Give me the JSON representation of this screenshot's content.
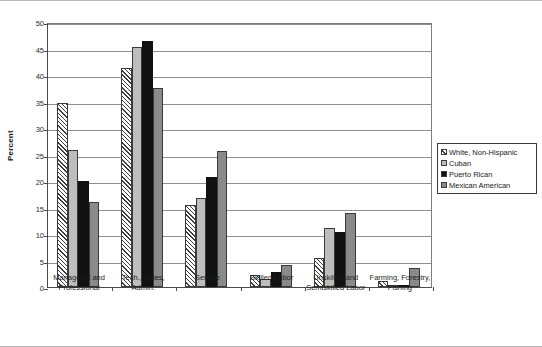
{
  "chart_data": {
    "type": "bar",
    "title": "",
    "xlabel": "",
    "ylabel": "Percent",
    "ylim": [
      0,
      50
    ],
    "yticks": [
      0,
      5,
      10,
      15,
      20,
      25,
      30,
      35,
      40,
      45,
      50
    ],
    "grid": true,
    "legend_position": "right",
    "categories": [
      "Managerial and Professional",
      "Tech., Sales, Admin.",
      "Service",
      "Skilled Labor",
      "Unskilled and Semiskilled  Labor",
      "Farming, Forestry, Fishing"
    ],
    "category_lines": [
      [
        "Managerial and",
        "Professional"
      ],
      [
        "Tech., Sales,",
        "Admin."
      ],
      [
        "Service"
      ],
      [
        "Skilled Labor"
      ],
      [
        "Unskilled and",
        "Semiskilled  Labor"
      ],
      [
        "Farming, Forestry,",
        "Fishing"
      ]
    ],
    "series": [
      {
        "name": "White, Non-Hispanic",
        "fill": "hatch",
        "color": "#ffffff",
        "values": [
          34.8,
          41.3,
          15.5,
          2.2,
          5.4,
          1.2
        ]
      },
      {
        "name": "Cuban",
        "fill": "lightgray",
        "color": "#bdbdbd",
        "values": [
          25.8,
          45.2,
          16.8,
          1.5,
          11.1,
          0.2
        ]
      },
      {
        "name": "Puerto Rican",
        "fill": "black",
        "color": "#111111",
        "values": [
          20.0,
          46.4,
          20.7,
          2.8,
          10.4,
          0.3
        ]
      },
      {
        "name": "Mexican American",
        "fill": "midgray",
        "color": "#8a8a8a",
        "values": [
          16.0,
          37.6,
          25.7,
          4.2,
          14.0,
          3.5
        ]
      }
    ]
  },
  "legend": {
    "items": [
      "White, Non-Hispanic",
      "Cuban",
      "Puerto Rican",
      "Mexican American"
    ]
  },
  "axis": {
    "y_label": "Percent"
  }
}
